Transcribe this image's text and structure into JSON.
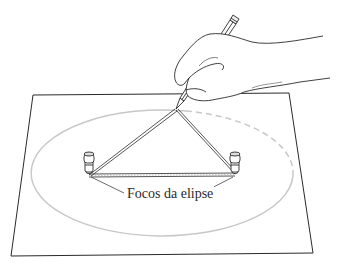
{
  "figure": {
    "caption_label": "Focos da elipse",
    "colors": {
      "ink": "#2a2a2a",
      "ellipse": "#c8c8c8",
      "paper": "#ffffff"
    },
    "paper_corners": [
      [
        33,
        95
      ],
      [
        289,
        93
      ],
      [
        313,
        253
      ],
      [
        11,
        256
      ]
    ],
    "ellipse": {
      "cx": 162,
      "cy": 173,
      "rx": 131,
      "ry": 63
    },
    "foci": [
      [
        89,
        174
      ],
      [
        235,
        174
      ]
    ],
    "pencil_tip": [
      176,
      109
    ]
  }
}
